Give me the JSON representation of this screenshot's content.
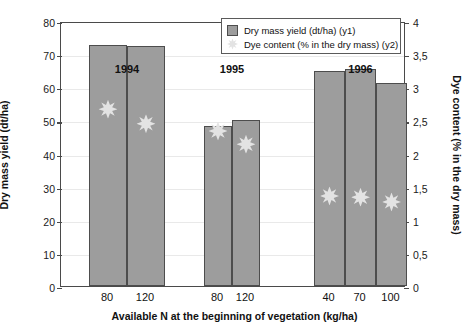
{
  "chart_data": {
    "type": "bar",
    "title": "",
    "xlabel": "Available N at the beginning of vegetation (kg/ha)",
    "ylabel": "Dry mass yield (dt/ha)",
    "y2label": "Dye content (% in the dry mass)",
    "ylim": [
      0,
      80
    ],
    "y2lim": [
      0,
      4
    ],
    "yticks": [
      "0",
      "10",
      "20",
      "30",
      "40",
      "50",
      "60",
      "70",
      "80"
    ],
    "ytick_values": [
      0,
      10,
      20,
      30,
      40,
      50,
      60,
      70,
      80
    ],
    "y2ticks": [
      "0",
      "0,5",
      "1",
      "1,5",
      "2",
      "2,5",
      "3",
      "3,5",
      "4"
    ],
    "y2tick_values": [
      0,
      0.5,
      1,
      1.5,
      2,
      2.5,
      3,
      3.5,
      4
    ],
    "grid": true,
    "legend_position": "top-right",
    "categories": [
      "80",
      "120",
      "80",
      "120",
      "40",
      "70",
      "100"
    ],
    "groups": [
      {
        "label": "1994",
        "categories": [
          "80",
          "120"
        ]
      },
      {
        "label": "1995",
        "categories": [
          "80",
          "120"
        ]
      },
      {
        "label": "1996",
        "categories": [
          "40",
          "70",
          "100"
        ]
      }
    ],
    "series": [
      {
        "name": "Dry mass yield (dt/ha) (y1)",
        "axis": "y1",
        "type": "bar",
        "color": "#9d9d9d",
        "values": [
          72.8,
          72.5,
          48.3,
          50.2,
          65.0,
          65.5,
          61.2
        ]
      },
      {
        "name": "Dye content (% in the dry mass) (y2)",
        "axis": "y2",
        "type": "scatter",
        "color": "#e3e3e3",
        "values": [
          2.7,
          2.48,
          2.37,
          2.17,
          1.39,
          1.37,
          1.3
        ]
      }
    ]
  },
  "legend": {
    "items": [
      {
        "label": "Dry mass yield (dt/ha) (y1)",
        "marker": "bar-swatch"
      },
      {
        "label": "Dye content (% in the dry mass) (y2)",
        "marker": "star-swatch"
      }
    ]
  }
}
